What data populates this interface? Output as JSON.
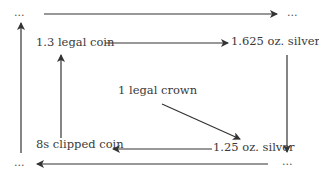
{
  "diagram": {
    "type": "flow-cycle",
    "nodes": {
      "top_left": "...",
      "top_right": "...",
      "bottom_left": "...",
      "bottom_right": "...",
      "legal_coin": "1.3 legal coin",
      "silver_1625": "1.625 oz. silver",
      "legal_crown": "1 legal crown",
      "silver_125": "1.25 oz. silver",
      "clipped_coin": "8s clipped coin"
    },
    "edges": [
      {
        "from": "top_left",
        "to": "top_right"
      },
      {
        "from": "legal_coin",
        "to": "silver_1625"
      },
      {
        "from": "silver_1625",
        "to": "bottom_right"
      },
      {
        "from": "legal_crown",
        "to": "silver_125"
      },
      {
        "from": "silver_125",
        "to": "clipped_coin"
      },
      {
        "from": "clipped_coin",
        "to": "legal_coin"
      },
      {
        "from": "bottom_right",
        "to": "bottom_left"
      },
      {
        "from": "bottom_left",
        "to": "top_left"
      }
    ],
    "colors": {
      "line": "#333333",
      "text": "#3a3a3a",
      "background": "#ffffff"
    }
  }
}
